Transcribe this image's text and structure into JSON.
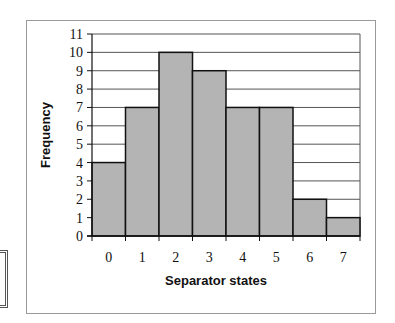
{
  "chart_data": {
    "type": "bar",
    "title": "",
    "xlabel": "Separator states",
    "ylabel": "Frequency",
    "categories": [
      "0",
      "1",
      "2",
      "3",
      "4",
      "5",
      "6",
      "7"
    ],
    "values": [
      4,
      7,
      10,
      9,
      7,
      7,
      2,
      1
    ],
    "ylim": [
      0,
      11
    ],
    "yticks": [
      0,
      1,
      2,
      3,
      4,
      5,
      6,
      7,
      8,
      9,
      10,
      11
    ],
    "grid": true,
    "legend": null,
    "bar_color": "#b4b4b4",
    "bar_edge_color": "#111111",
    "grid_color": "#555555"
  }
}
